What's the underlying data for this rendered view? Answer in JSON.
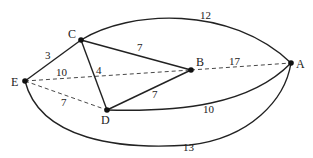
{
  "nodes": {
    "A": {
      "label": "A"
    },
    "B": {
      "label": "B"
    },
    "C": {
      "label": "C"
    },
    "D": {
      "label": "D"
    },
    "E": {
      "label": "E"
    }
  },
  "edges": [
    {
      "from": "E",
      "to": "C",
      "weight": "3",
      "style": "solid"
    },
    {
      "from": "C",
      "to": "B",
      "weight": "7",
      "style": "solid"
    },
    {
      "from": "C",
      "to": "D",
      "weight": "4",
      "style": "solid"
    },
    {
      "from": "D",
      "to": "B",
      "weight": "7",
      "style": "solid"
    },
    {
      "from": "C",
      "to": "A",
      "weight": "12",
      "style": "solid-curve"
    },
    {
      "from": "E",
      "to": "B",
      "weight": "10",
      "style": "dashed"
    },
    {
      "from": "B",
      "to": "A",
      "weight": "17",
      "style": "dashed"
    },
    {
      "from": "E",
      "to": "D",
      "weight": "7",
      "style": "dashed"
    },
    {
      "from": "D",
      "to": "A",
      "weight": "10",
      "style": "solid-curve"
    },
    {
      "from": "E",
      "to": "A",
      "weight": "13",
      "style": "solid-curve"
    }
  ],
  "colors": {
    "stroke": "#222222",
    "background": "#ffffff"
  }
}
